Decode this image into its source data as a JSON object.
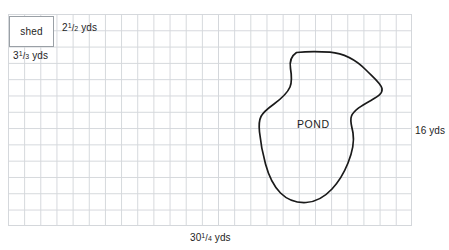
{
  "diagram": {
    "grid": {
      "columns": 25,
      "rows": 13,
      "cell_px": 16,
      "line_color": "#c9cdd2",
      "background": "#ffffff"
    },
    "shed": {
      "label": "shed",
      "width_label": {
        "whole": "2",
        "numerator": "1",
        "denominator": "2",
        "unit": "yds"
      },
      "height_label": {
        "whole": "3",
        "numerator": "1",
        "denominator": "3",
        "unit": "yds"
      }
    },
    "yard": {
      "width_label": {
        "whole": "30",
        "numerator": "1",
        "denominator": "4",
        "unit": "yds"
      },
      "height_label": "16 yds"
    },
    "pond": {
      "label": "POND",
      "outline_color": "#1a1a1a",
      "outline_width": 1.7
    }
  }
}
